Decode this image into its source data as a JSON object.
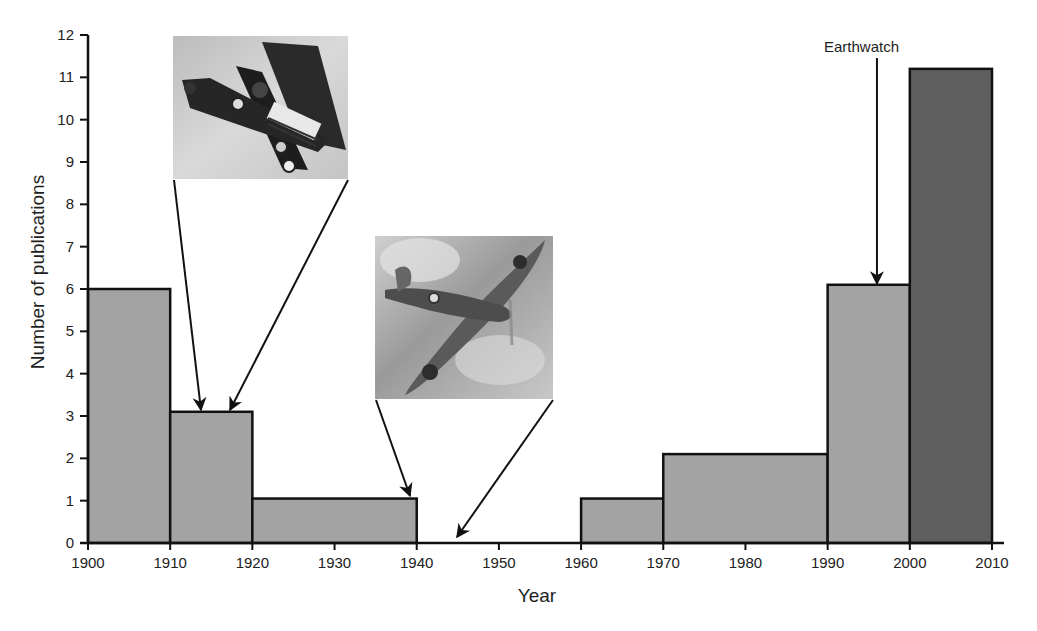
{
  "chart_data": {
    "type": "bar",
    "title": "",
    "xlabel": "Year",
    "ylabel": "Number of publications",
    "xlim": [
      1900,
      2010
    ],
    "ylim": [
      0,
      12
    ],
    "x_ticks": [
      1900,
      1910,
      1920,
      1930,
      1940,
      1950,
      1960,
      1970,
      1980,
      1990,
      2000,
      2010
    ],
    "y_ticks": [
      0,
      1,
      2,
      3,
      4,
      5,
      6,
      7,
      8,
      9,
      10,
      11,
      12
    ],
    "grid": false,
    "series": [
      {
        "name": "Publications per decade",
        "color": "#a3a3a3",
        "bins": [
          {
            "start": 1900,
            "end": 1910,
            "value": 6.0
          },
          {
            "start": 1910,
            "end": 1920,
            "value": 3.1
          },
          {
            "start": 1920,
            "end": 1940,
            "value": 1.05
          },
          {
            "start": 1940,
            "end": 1960,
            "value": 0
          },
          {
            "start": 1960,
            "end": 1970,
            "value": 1.05
          },
          {
            "start": 1970,
            "end": 1990,
            "value": 2.1
          },
          {
            "start": 1990,
            "end": 2000,
            "value": 6.1
          }
        ]
      },
      {
        "name": "Publications 2000-2010",
        "color": "#5e5e5e",
        "bins": [
          {
            "start": 2000,
            "end": 2010,
            "value": 11.2
          }
        ]
      }
    ],
    "annotations": [
      {
        "type": "label-arrow",
        "text": "Earthwatch",
        "x": 1996,
        "y": 6.1
      },
      {
        "type": "image",
        "name": "biplane-photo",
        "description": "WWI biplane photograph",
        "points_to": [
          {
            "x": 1914,
            "y": 3.1
          },
          {
            "x": 1917,
            "y": 3.1
          }
        ]
      },
      {
        "type": "image",
        "name": "spitfire-photo",
        "description": "WWII Spitfire photograph",
        "points_to": [
          {
            "x": 1939,
            "y": 1.05
          },
          {
            "x": 1945,
            "y": 0
          }
        ]
      }
    ]
  }
}
